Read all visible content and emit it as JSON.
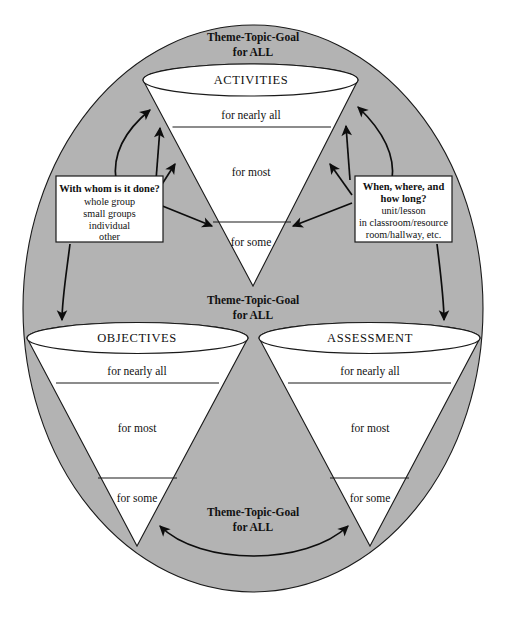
{
  "diagram": {
    "title_top": {
      "line1": "Theme-Topic-Goal",
      "line2": "for ALL"
    },
    "title_middle": {
      "line1": "Theme-Topic-Goal",
      "line2": "for ALL"
    },
    "title_bottom": {
      "line1": "Theme-Topic-Goal",
      "line2": "for ALL"
    },
    "funnels": [
      {
        "id": "activities",
        "label": "ACTIVITIES",
        "tiers": [
          "for nearly all",
          "for most",
          "for some"
        ]
      },
      {
        "id": "objectives",
        "label": "OBJECTIVES",
        "tiers": [
          "for nearly all",
          "for most",
          "for some"
        ]
      },
      {
        "id": "assessment",
        "label": "ASSESSMENT",
        "tiers": [
          "for nearly all",
          "for most",
          "for some"
        ]
      }
    ],
    "callouts": [
      {
        "id": "who",
        "title": "With whom is it done?",
        "lines": [
          "whole group",
          "small groups",
          "individual",
          "other"
        ]
      },
      {
        "id": "when-where",
        "title_line1": "When, where, and",
        "title_line2": "how long?",
        "lines": [
          "unit/lesson",
          "in classroom/resource",
          "room/hallway, etc."
        ]
      }
    ],
    "colors": {
      "shell_fill": "#b3b3b3",
      "funnel_fill": "#ffffff",
      "stroke": "#1a1a1a",
      "text": "#111111",
      "page_background": "#ffffff"
    }
  }
}
